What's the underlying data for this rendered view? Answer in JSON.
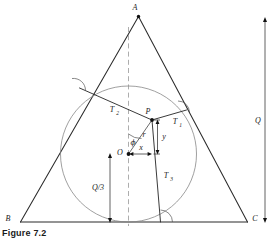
{
  "figure": {
    "caption": "Figure 7.2",
    "vertices": {
      "apex": "A",
      "bottom_left": "B",
      "bottom_right": "C"
    },
    "points": {
      "center": "O",
      "interior": "P"
    },
    "tangent_labels": {
      "right_side": "T",
      "right_side_sub": "1",
      "left_side": "T",
      "left_side_sub": "2",
      "base": "T",
      "base_sub": "3"
    },
    "coordinates": {
      "radial": "r",
      "angle": "ϕ",
      "horizontal": "x",
      "vertical": "y"
    },
    "dimensions": {
      "inradius_label": "Q/3",
      "height_label": "Q"
    }
  },
  "colors": {
    "triangle_stroke": "#2b2b2b",
    "circle_stroke": "#808080",
    "dash_stroke": "#8a8a8a",
    "thin_stroke": "#3a3a3a",
    "arc_stroke": "#555555",
    "text": "#1a1a1a",
    "background": "#ffffff"
  }
}
